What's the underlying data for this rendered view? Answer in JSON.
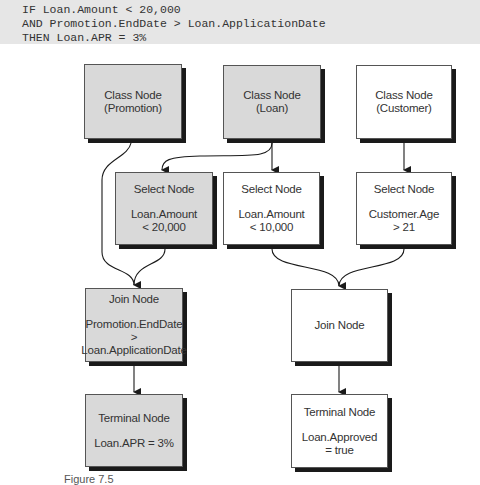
{
  "code": {
    "lines": [
      "IF Loan.Amount < 20,000",
      "AND Promotion.EndDate > Loan.ApplicationDate",
      "THEN Loan.APR = 3%"
    ]
  },
  "nodes": {
    "class_promotion": {
      "title": "Class Node",
      "detail": "(Promotion)",
      "fill": "gray"
    },
    "class_loan": {
      "title": "Class Node",
      "detail": "(Loan)",
      "fill": "gray"
    },
    "class_customer": {
      "title": "Class Node",
      "detail": "(Customer)",
      "fill": "white"
    },
    "select_amount_20000": {
      "title": "Select Node",
      "detail": "Loan.Amount\n< 20,000",
      "fill": "gray"
    },
    "select_amount_10000": {
      "title": "Select Node",
      "detail": "Loan.Amount\n< 10,000",
      "fill": "white"
    },
    "select_age": {
      "title": "Select Node",
      "detail": "Customer.Age\n> 21",
      "fill": "white"
    },
    "join_promotion_loan": {
      "title": "Join Node",
      "detail": "Promotion.EndDate >\nLoan.ApplicationDate",
      "fill": "gray"
    },
    "join_loan_customer": {
      "title": "Join Node",
      "detail": "",
      "fill": "white"
    },
    "terminal_apr": {
      "title": "Terminal Node",
      "detail": "Loan.APR = 3%",
      "fill": "gray"
    },
    "terminal_approved": {
      "title": "Terminal Node",
      "detail": "Loan.Approved\n= true",
      "fill": "white"
    }
  },
  "edges": [
    {
      "from": "class_promotion",
      "to": "join_promotion_loan"
    },
    {
      "from": "class_loan",
      "to": "select_amount_20000"
    },
    {
      "from": "class_loan",
      "to": "select_amount_10000"
    },
    {
      "from": "class_customer",
      "to": "select_age"
    },
    {
      "from": "select_amount_20000",
      "to": "join_promotion_loan"
    },
    {
      "from": "select_amount_10000",
      "to": "join_loan_customer"
    },
    {
      "from": "select_age",
      "to": "join_loan_customer"
    },
    {
      "from": "join_promotion_loan",
      "to": "terminal_apr"
    },
    {
      "from": "join_loan_customer",
      "to": "terminal_approved"
    }
  ],
  "colors": {
    "highlight_fill": "#d9d9d9",
    "normal_fill": "#ffffff",
    "shadow": "#1a1a1a",
    "code_background": "#e6e6e6"
  },
  "caption": "Figure 7.5"
}
